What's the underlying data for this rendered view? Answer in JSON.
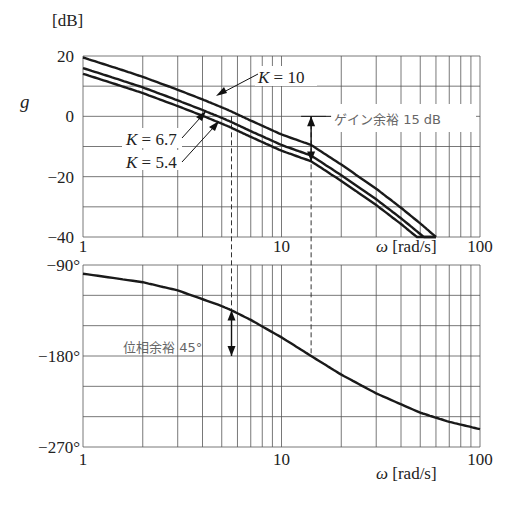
{
  "chart_data": [
    {
      "type": "line",
      "title": "",
      "xlabel": "ω [rad/s]",
      "ylabel": "g",
      "yunit": "[dB]",
      "xscale": "log",
      "xlim": [
        1,
        100
      ],
      "ylim": [
        -40,
        20
      ],
      "yticks": [
        20,
        0,
        -20,
        -40
      ],
      "ytick_labels": [
        "20",
        "0",
        "−20",
        "−40"
      ],
      "xticks": [
        1,
        10,
        100
      ],
      "xtick_labels": [
        "1",
        "10",
        "100"
      ],
      "grid": true,
      "x": [
        1,
        1.5,
        2,
        3,
        4,
        5,
        5.6,
        7,
        10,
        14.1,
        20,
        30,
        40,
        50,
        60
      ],
      "series": [
        {
          "name": "K = 10",
          "values": [
            19.5,
            15.8,
            13.1,
            8.8,
            5.6,
            3.0,
            1.6,
            -1.4,
            -6.0,
            -9.5,
            -16.0,
            -24.0,
            -30.3,
            -35.5,
            -40.0
          ]
        },
        {
          "name": "K = 6.7",
          "values": [
            16.0,
            12.3,
            9.6,
            5.3,
            2.1,
            -0.5,
            -1.9,
            -4.9,
            -9.5,
            -13.0,
            -19.5,
            -27.5,
            -33.8,
            -39.0,
            -43.5
          ]
        },
        {
          "name": "K = 5.4",
          "values": [
            14.1,
            10.4,
            7.7,
            3.4,
            0.2,
            -2.4,
            -3.8,
            -6.8,
            -11.4,
            -14.9,
            -21.4,
            -29.4,
            -35.7,
            -40.9,
            -45.4
          ]
        }
      ],
      "annotations": [
        {
          "text_k": "K",
          "text_v": "= 10",
          "target_series": "K = 10"
        },
        {
          "text_k": "K",
          "text_v": "= 6.7",
          "target_series": "K = 6.7"
        },
        {
          "text_k": "K",
          "text_v": "= 5.4",
          "target_series": "K = 5.4"
        },
        {
          "text": "ゲイン余裕 15 dB",
          "omega": 14.1,
          "from_db": 0,
          "to_db": -15
        }
      ],
      "dashed_markers_omega": [
        5.6,
        14.1
      ]
    },
    {
      "type": "line",
      "title": "",
      "xlabel": "ω [rad/s]",
      "ylabel": "",
      "xscale": "log",
      "xlim": [
        1,
        100
      ],
      "ylim": [
        -270,
        -90
      ],
      "yticks": [
        -90,
        -180,
        -270
      ],
      "ytick_labels": [
        "−90°",
        "−180°",
        "−270°"
      ],
      "xticks": [
        1,
        10,
        100
      ],
      "xtick_labels": [
        "1",
        "10",
        "100"
      ],
      "grid": true,
      "x": [
        1,
        2,
        3,
        5,
        5.6,
        7,
        10,
        14.1,
        20,
        30,
        50,
        70,
        100
      ],
      "series": [
        {
          "name": "phase",
          "values": [
            -98.6,
            -107.0,
            -115.1,
            -130.6,
            -134.8,
            -144.3,
            -161.6,
            -180.0,
            -198.4,
            -217.0,
            -236.1,
            -245.1,
            -252.4
          ]
        }
      ],
      "annotations": [
        {
          "text": "位相余裕 45°",
          "omega": 5.6,
          "from_deg": -135,
          "to_deg": -180
        }
      ],
      "dashed_markers_omega": [
        5.6,
        14.1
      ]
    }
  ],
  "labels": {
    "db_unit": "[dB]",
    "g": "g",
    "omega_unit": "[rad/s]",
    "omega_symbol": "ω",
    "k": "K",
    "k10": "= 10",
    "k67": "= 6.7",
    "k54": "= 5.4",
    "gain_margin": "ゲイン余裕 15 dB",
    "phase_margin": "位相余裕 45°"
  }
}
